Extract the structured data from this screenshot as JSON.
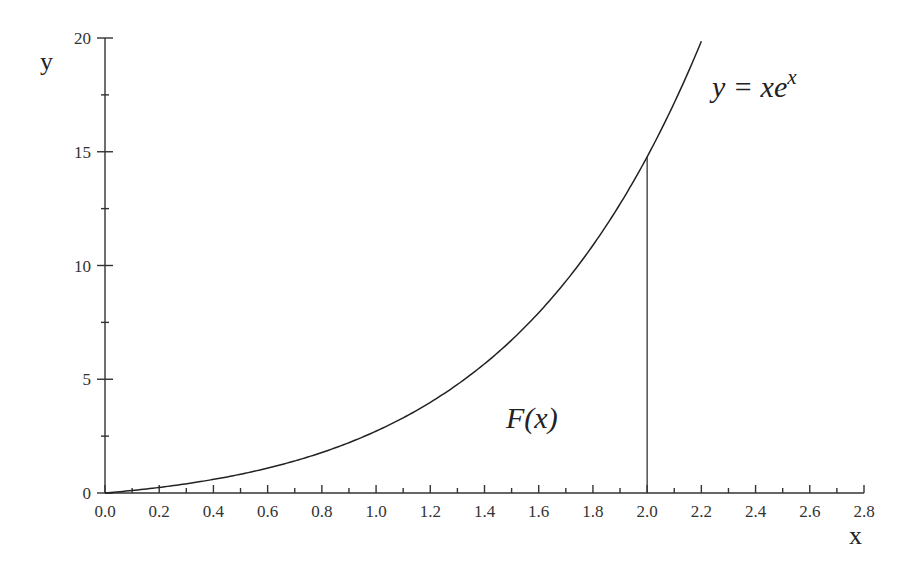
{
  "chart_data": {
    "type": "line",
    "title": "",
    "xlabel": "x",
    "ylabel": "y",
    "xlim": [
      0.0,
      2.8
    ],
    "ylim": [
      0,
      20
    ],
    "grid": false,
    "legend": null,
    "x_ticks": [
      "0.0",
      "0.2",
      "0.4",
      "0.6",
      "0.8",
      "1.0",
      "1.2",
      "1.4",
      "1.6",
      "1.8",
      "2.0",
      "2.2",
      "2.4",
      "2.6",
      "2.8"
    ],
    "x_minor_step": 0.1,
    "y_ticks": [
      "0",
      "5",
      "10",
      "15",
      "20"
    ],
    "y_minor_step": 2.5,
    "series": [
      {
        "name": "y = xe^x",
        "function": "x*exp(x)",
        "x_range": [
          0.0,
          2.2
        ],
        "x": [
          0.0,
          0.2,
          0.4,
          0.6,
          0.8,
          1.0,
          1.2,
          1.4,
          1.6,
          1.8,
          2.0,
          2.2
        ],
        "values": [
          0.0,
          0.24,
          0.6,
          1.09,
          1.78,
          2.72,
          3.98,
          5.68,
          7.92,
          10.89,
          14.78,
          19.85
        ]
      }
    ],
    "annotations": [
      {
        "text": "y = xe",
        "superscript": "x",
        "label": "curve-label"
      },
      {
        "text": "F(x)",
        "label": "area-label"
      },
      {
        "type": "vertical-line",
        "x": 2.0,
        "y_top": 14.78
      }
    ]
  },
  "labels": {
    "curve_main": "y = xe",
    "curve_sup": "x",
    "area": "F(x)",
    "x_axis_title": "x",
    "y_axis_title": "y"
  }
}
